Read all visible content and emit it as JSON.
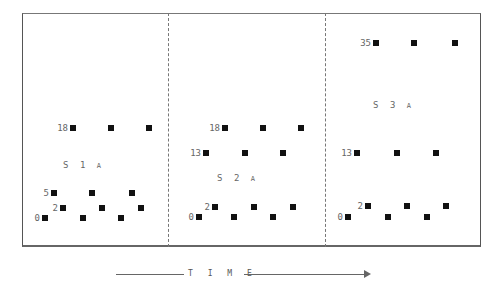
{
  "diagram": {
    "time_label": "T I M E",
    "panels": [
      {
        "id": "S1",
        "label": "S 1",
        "label_suffix": "A",
        "label_pos": [
          82,
          165
        ],
        "rows": [
          {
            "value": "18",
            "y": 128,
            "xs": [
              73,
              111,
              149
            ]
          },
          {
            "value": "5",
            "y": 193,
            "xs": [
              54,
              92,
              132
            ]
          },
          {
            "value": "2",
            "y": 208,
            "xs": [
              63,
              102,
              141
            ]
          },
          {
            "value": "0",
            "y": 218,
            "xs": [
              45,
              83,
              121
            ]
          }
        ]
      },
      {
        "id": "S2",
        "label": "S 2",
        "label_suffix": "A",
        "label_pos": [
          236,
          178
        ],
        "rows": [
          {
            "value": "18",
            "y": 128,
            "xs": [
              225,
              263,
              301
            ]
          },
          {
            "value": "13",
            "y": 153,
            "xs": [
              206,
              245,
              283
            ]
          },
          {
            "value": "2",
            "y": 207,
            "xs": [
              215,
              254,
              293
            ]
          },
          {
            "value": "0",
            "y": 217,
            "xs": [
              199,
              234,
              273
            ]
          }
        ]
      },
      {
        "id": "S3",
        "label": "S 3",
        "label_suffix": "A",
        "label_pos": [
          392,
          105
        ],
        "rows": [
          {
            "value": "35",
            "y": 43,
            "xs": [
              376,
              414,
              455
            ]
          },
          {
            "value": "13",
            "y": 153,
            "xs": [
              357,
              397,
              436
            ]
          },
          {
            "value": "2",
            "y": 206,
            "xs": [
              368,
              407,
              446
            ]
          },
          {
            "value": "0",
            "y": 217,
            "xs": [
              348,
              388,
              427
            ]
          }
        ]
      }
    ],
    "dividers_x": [
      168,
      325
    ]
  }
}
